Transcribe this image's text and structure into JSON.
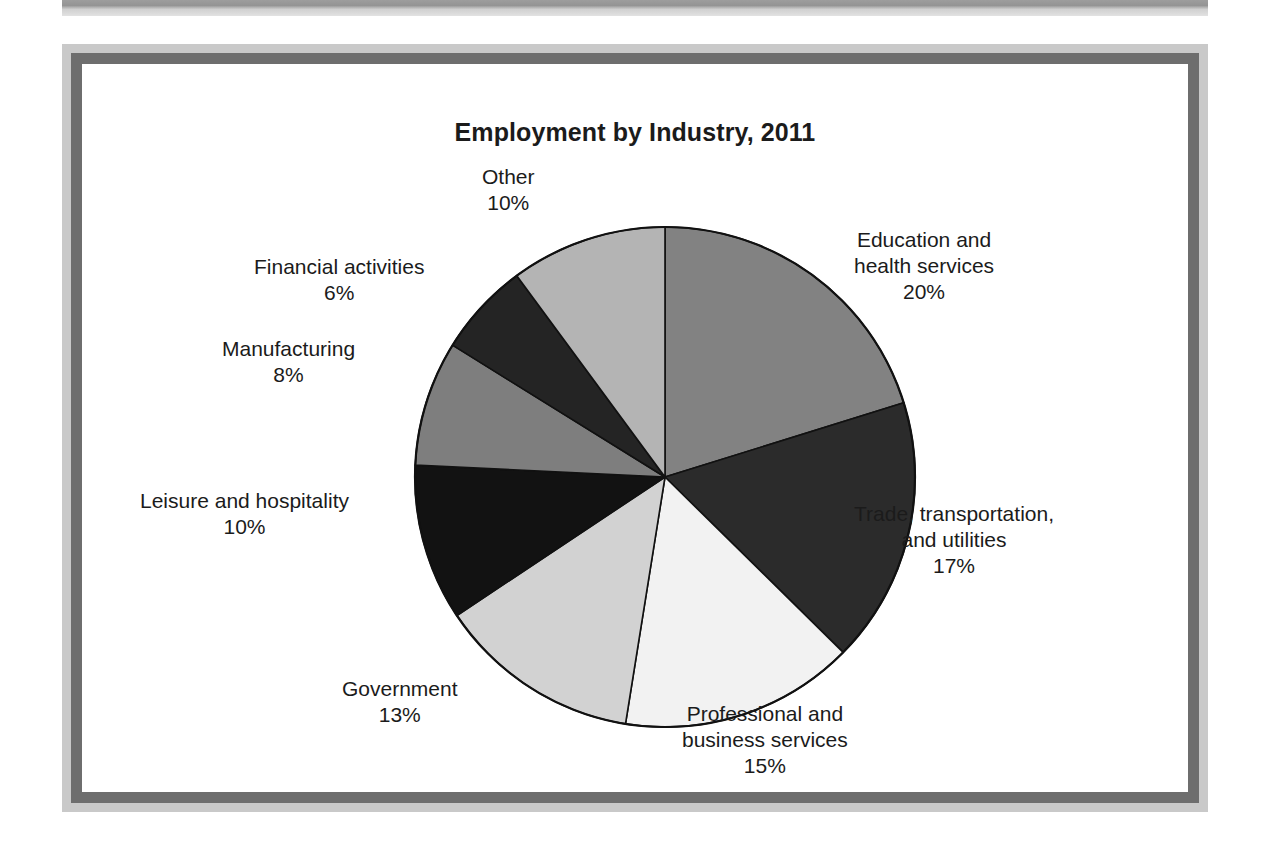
{
  "figure": {
    "title": "Employment by Industry, 2011"
  },
  "chart_data": {
    "type": "pie",
    "title": "Employment by Industry, 2011",
    "xlabel": "",
    "ylabel": "",
    "legend_position": "none",
    "value_suffix": "%",
    "start_angle_deg": 0,
    "direction": "clockwise",
    "categories": [
      "Education and health services",
      "Trade, transportation, and utilities",
      "Professional and business services",
      "Government",
      "Leisure and hospitality",
      "Manufacturing",
      "Financial activities",
      "Other"
    ],
    "values": [
      20,
      17,
      15,
      13,
      10,
      8,
      6,
      10
    ],
    "slices": [
      {
        "name": "Education and health services",
        "label_line1": "Education and",
        "label_line2": "health services",
        "value": 20,
        "value_label": "20%",
        "color": "#828282"
      },
      {
        "name": "Trade, transportation, and utilities",
        "label_line1": "Trade, transportation,",
        "label_line2": "and utilities",
        "value": 17,
        "value_label": "17%",
        "color": "#2b2b2b"
      },
      {
        "name": "Professional and business services",
        "label_line1": "Professional and",
        "label_line2": "business services",
        "value": 15,
        "value_label": "15%",
        "color": "#f2f2f2"
      },
      {
        "name": "Government",
        "label_line1": "Government",
        "label_line2": "",
        "value": 13,
        "value_label": "13%",
        "color": "#d2d2d2"
      },
      {
        "name": "Leisure and hospitality",
        "label_line1": "Leisure and hospitality",
        "label_line2": "",
        "value": 10,
        "value_label": "10%",
        "color": "#121212"
      },
      {
        "name": "Manufacturing",
        "label_line1": "Manufacturing",
        "label_line2": "",
        "value": 8,
        "value_label": "8%",
        "color": "#7e7e7e"
      },
      {
        "name": "Financial activities",
        "label_line1": "Financial activities",
        "label_line2": "",
        "value": 6,
        "value_label": "6%",
        "color": "#242424"
      },
      {
        "name": "Other",
        "label_line1": "Other",
        "label_line2": "",
        "value": 10,
        "value_label": "10%",
        "color": "#b4b4b4"
      }
    ],
    "total": 100
  }
}
